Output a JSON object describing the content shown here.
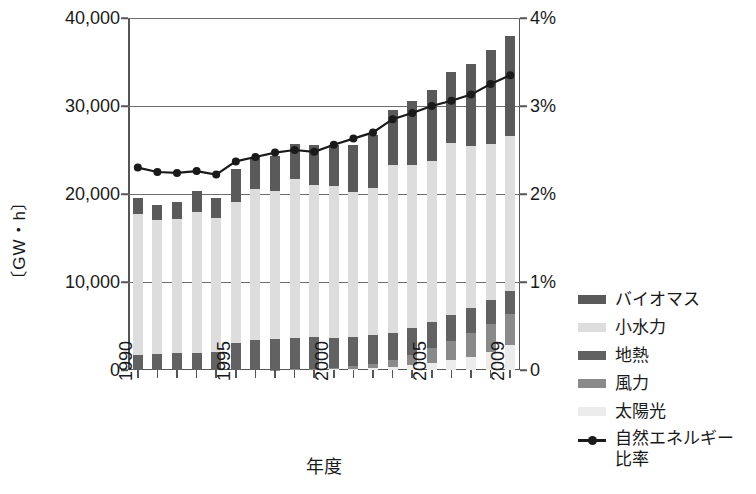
{
  "axes": {
    "y_left_label": "〔GW・h〕",
    "x_title": "年度",
    "y_left_ticks": [
      "0",
      "10,000",
      "20,000",
      "30,000",
      "40,000"
    ],
    "y_right_ticks": [
      "0",
      "1%",
      "2%",
      "3%",
      "4%"
    ],
    "x_ticks_labeled": [
      "1990",
      "1995",
      "2000",
      "2005",
      "2009"
    ]
  },
  "legend": {
    "items": [
      {
        "label": "バイオマス",
        "color": "#5a5a5a",
        "type": "swatch"
      },
      {
        "label": "小水力",
        "color": "#dddddd",
        "type": "swatch"
      },
      {
        "label": "地熱",
        "color": "#626262",
        "type": "swatch"
      },
      {
        "label": "風力",
        "color": "#8a8a8a",
        "type": "swatch"
      },
      {
        "label": "太陽光",
        "color": "#ececec",
        "type": "swatch"
      },
      {
        "label": "自然エネルギー比率",
        "color": "#1a1a1a",
        "type": "line"
      }
    ]
  },
  "chart_data": {
    "type": "bar",
    "title": "",
    "subtitle": "",
    "xlabel": "年度",
    "ylabel": "〔GW・h〕",
    "y2label": "",
    "ylim": [
      0,
      40000
    ],
    "y2lim": [
      0,
      4
    ],
    "grid": true,
    "legend_position": "right",
    "stacked": true,
    "categories": [
      "1990",
      "1991",
      "1992",
      "1993",
      "1994",
      "1995",
      "1996",
      "1997",
      "1998",
      "1999",
      "2000",
      "2001",
      "2002",
      "2003",
      "2004",
      "2005",
      "2006",
      "2007",
      "2008",
      "2009"
    ],
    "series": [
      {
        "name": "太陽光",
        "color": "#ececec",
        "axis": "left",
        "values": [
          0,
          0,
          0,
          0,
          0,
          0,
          0,
          0,
          0,
          30,
          70,
          130,
          230,
          350,
          550,
          800,
          1100,
          1500,
          2000,
          2800
        ]
      },
      {
        "name": "風力",
        "color": "#8a8a8a",
        "axis": "left",
        "values": [
          0,
          0,
          0,
          0,
          0,
          0,
          0,
          30,
          60,
          100,
          170,
          300,
          500,
          800,
          1200,
          1700,
          2200,
          2700,
          3200,
          3600
        ]
      },
      {
        "name": "地熱",
        "color": "#626262",
        "axis": "left",
        "values": [
          1700,
          1800,
          1900,
          1900,
          2000,
          3100,
          3400,
          3500,
          3600,
          3600,
          3400,
          3300,
          3200,
          3100,
          3000,
          3000,
          2900,
          2800,
          2700,
          2600
        ]
      },
      {
        "name": "小水力",
        "color": "#dddddd",
        "axis": "left",
        "values": [
          16000,
          15300,
          15300,
          16100,
          15300,
          16000,
          17200,
          16800,
          18000,
          17300,
          17300,
          16500,
          16700,
          19000,
          18600,
          18200,
          19600,
          18500,
          17800,
          17600
        ]
      },
      {
        "name": "バイオマス",
        "color": "#5a5a5a",
        "axis": "left",
        "values": [
          1900,
          1700,
          1900,
          2300,
          2200,
          3700,
          3600,
          4000,
          4000,
          4500,
          4600,
          5300,
          6100,
          6300,
          7200,
          8100,
          8100,
          9300,
          10700,
          11400
        ]
      },
      {
        "name": "自然エネルギー比率",
        "color": "#1a1a1a",
        "axis": "right",
        "type": "line",
        "values": [
          2.3,
          2.25,
          2.24,
          2.26,
          2.22,
          2.37,
          2.42,
          2.47,
          2.5,
          2.48,
          2.56,
          2.63,
          2.7,
          2.85,
          2.92,
          3.0,
          3.06,
          3.13,
          3.25,
          3.35
        ]
      }
    ]
  }
}
